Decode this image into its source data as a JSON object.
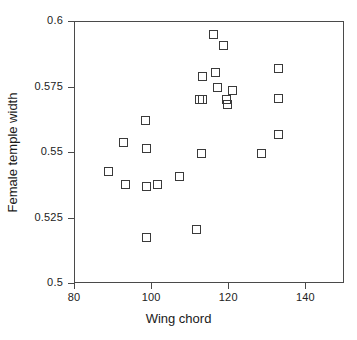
{
  "chart_data": {
    "type": "scatter",
    "title": "",
    "xlabel": "Wing chord",
    "ylabel": "Female temple width",
    "xlim": [
      80,
      150
    ],
    "ylim": [
      0.5,
      0.6
    ],
    "xticks": [
      80,
      100,
      120,
      140
    ],
    "xtick_labels": [
      "80",
      "100",
      "120",
      "140"
    ],
    "yticks": [
      0.5,
      0.525,
      0.55,
      0.575,
      0.6
    ],
    "ytick_labels": [
      "0.5",
      "0.525",
      "0.55",
      "0.575",
      "0.6"
    ],
    "grid": false,
    "legend": null,
    "marker": "open-square",
    "marker_color": "#3a3a3a",
    "series": [
      {
        "name": "observations",
        "points": [
          {
            "x": 88.9,
            "y": 0.5425
          },
          {
            "x": 92.8,
            "y": 0.5535
          },
          {
            "x": 93.3,
            "y": 0.5375
          },
          {
            "x": 98.6,
            "y": 0.562
          },
          {
            "x": 98.8,
            "y": 0.5515
          },
          {
            "x": 98.7,
            "y": 0.537
          },
          {
            "x": 98.9,
            "y": 0.5175
          },
          {
            "x": 101.6,
            "y": 0.5375
          },
          {
            "x": 107.3,
            "y": 0.5405
          },
          {
            "x": 111.8,
            "y": 0.5205
          },
          {
            "x": 112.5,
            "y": 0.57
          },
          {
            "x": 113.2,
            "y": 0.579
          },
          {
            "x": 113.4,
            "y": 0.57
          },
          {
            "x": 113.0,
            "y": 0.5495
          },
          {
            "x": 116.1,
            "y": 0.595
          },
          {
            "x": 116.6,
            "y": 0.5805
          },
          {
            "x": 117.2,
            "y": 0.5745
          },
          {
            "x": 118.7,
            "y": 0.5905
          },
          {
            "x": 119.6,
            "y": 0.57
          },
          {
            "x": 119.8,
            "y": 0.568
          },
          {
            "x": 121.0,
            "y": 0.5735
          },
          {
            "x": 128.5,
            "y": 0.5495
          },
          {
            "x": 132.9,
            "y": 0.582
          },
          {
            "x": 133.0,
            "y": 0.5705
          },
          {
            "x": 132.9,
            "y": 0.5565
          }
        ]
      }
    ]
  }
}
